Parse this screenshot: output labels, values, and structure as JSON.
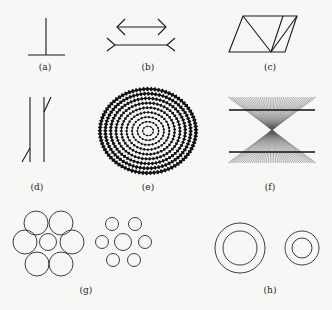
{
  "figure": {
    "background": "#f7f7f5",
    "ink": "#1a1a1a",
    "panels": [
      {
        "id": "a",
        "label": "(a)",
        "name": "vertical-horizontal-illusion",
        "label_pos": [
          45,
          70
        ]
      },
      {
        "id": "b",
        "label": "(b)",
        "name": "muller-lyer-illusion",
        "label_pos": [
          148,
          70
        ]
      },
      {
        "id": "c",
        "label": "(c)",
        "name": "sander-parallelogram",
        "label_pos": [
          270,
          70
        ]
      },
      {
        "id": "d",
        "label": "(d)",
        "name": "poggendorff-illusion",
        "label_pos": [
          37,
          190
        ]
      },
      {
        "id": "e",
        "label": "(e)",
        "name": "fraser-spiral-illusion",
        "label_pos": [
          148,
          190
        ]
      },
      {
        "id": "f",
        "label": "(f)",
        "name": "hering-illusion",
        "label_pos": [
          270,
          190
        ]
      },
      {
        "id": "g",
        "label": "(g)",
        "name": "ebbinghaus-illusion",
        "label_pos": [
          86,
          293
        ]
      },
      {
        "id": "h",
        "label": "(h)",
        "name": "delboeuf-illusion",
        "label_pos": [
          270,
          293
        ]
      }
    ],
    "spiral": {
      "cx": 148,
      "cy": 131,
      "rx": 48,
      "ry": 42,
      "rings": 9
    },
    "hering": {
      "cx": 272,
      "cy": 129,
      "x0": 228,
      "x1": 316,
      "top": 97,
      "bottom": 163,
      "rays": 44,
      "line_y": [
        110,
        152
      ]
    }
  }
}
